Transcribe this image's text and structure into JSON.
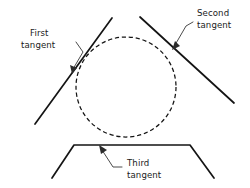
{
  "figure": {
    "background_color": "#ffffff",
    "line_color": "#141414",
    "leader_color": "#2b2b2b",
    "text_color": "#1a1a1a",
    "circle": {
      "name": "dashed-circle",
      "center_x": 126,
      "center_y": 87,
      "radius": 50,
      "style": "dashed"
    },
    "labels": {
      "first": {
        "line1": "First",
        "line2": "tangent",
        "x": 30,
        "y1": 36,
        "y2": 48
      },
      "second": {
        "line1": "Second",
        "line2": "tangent",
        "x": 196,
        "y1": 16,
        "y2": 28
      },
      "third": {
        "line1": "Third",
        "line2": "tangent",
        "x": 126,
        "y1": 166,
        "y2": 178
      }
    },
    "tangents": [
      {
        "name": "first-tangent",
        "label": "First tangent",
        "x1": 35,
        "y1": 124,
        "x2": 112,
        "y2": 18
      },
      {
        "name": "second-tangent",
        "label": "Second tangent",
        "x1": 140,
        "y1": 17,
        "x2": 234,
        "y2": 103
      },
      {
        "name": "third-tangent",
        "label": "Third tangent",
        "path": "M 52 178 L 74 145 L 190 145 L 214 178"
      }
    ]
  }
}
